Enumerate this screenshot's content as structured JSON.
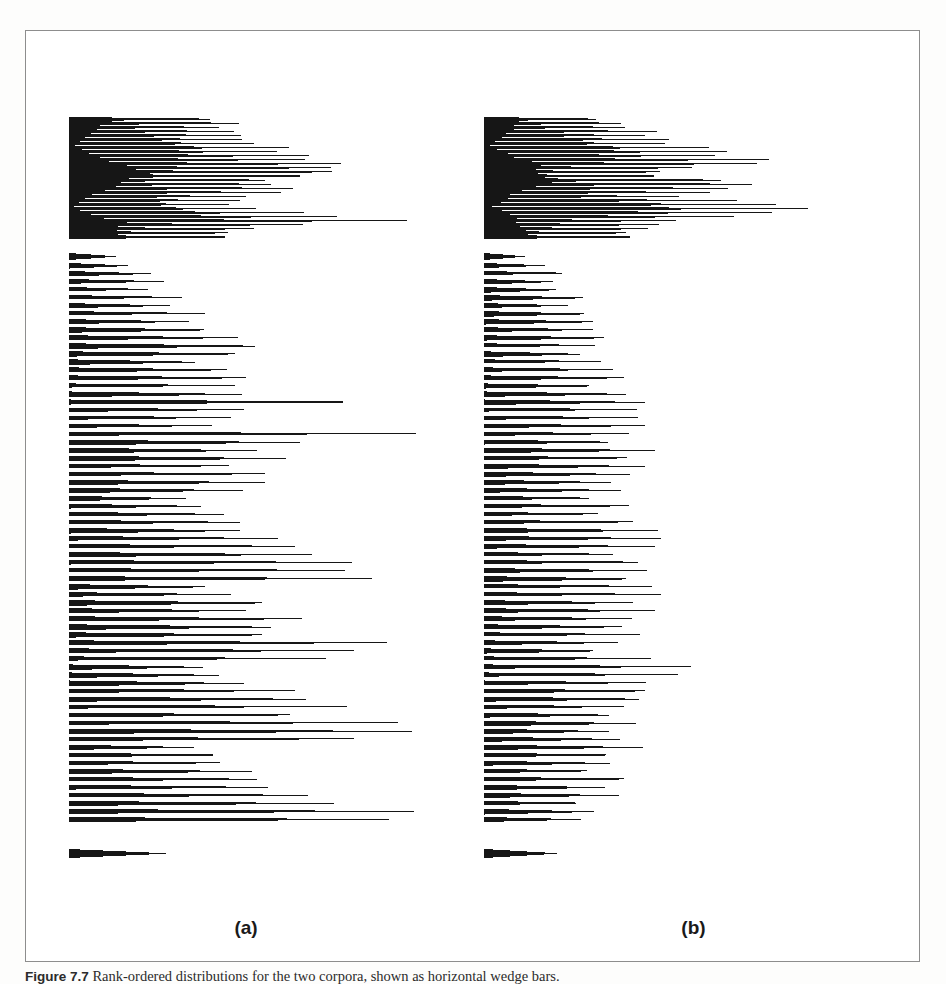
{
  "figure": {
    "panel_a_label": "(a)",
    "panel_b_label": "(b)",
    "caption_lead": "Figure 7.7",
    "caption_text": "Rank-ordered distributions for the two corpora, shown as horizontal wedge bars."
  },
  "colors": {
    "ink": "#161616",
    "frame": "#8d8d8d",
    "paper": "#ffffff"
  },
  "chart_data": [
    {
      "type": "bar",
      "orientation": "horizontal",
      "title": "(a)",
      "xlabel": "",
      "ylabel": "",
      "xlim": [
        0,
        400
      ],
      "grid": false,
      "legend": null,
      "note": "Rank-ordered horizontal wedge bars; bar n is drawn as a tapered wedge from the common left baseline to its value. Leading solid block is a dense cluster of very closely spaced long bars.",
      "baseline_x_px": 43,
      "row_pitch_px": 8.0,
      "first_row_y_px": 86,
      "categories": [
        "r1",
        "r2",
        "r3",
        "r4",
        "r5",
        "r6",
        "r7",
        "r8",
        "r9",
        "r10",
        "r11",
        "r12",
        "r13",
        "r14",
        "r15",
        "r16",
        "r17",
        "r18",
        "r19",
        "r20",
        "r21",
        "r22",
        "r23",
        "r24",
        "r25",
        "r26",
        "r27",
        "r28",
        "r29",
        "r30",
        "r31",
        "r32",
        "r33",
        "r34",
        "r35",
        "r36",
        "r37",
        "r38",
        "r39",
        "r40",
        "r41",
        "r42",
        "r43",
        "r44",
        "r45",
        "r46",
        "r47",
        "r48",
        "r49",
        "r50",
        "r51",
        "r52",
        "r53",
        "r54",
        "r55",
        "r56",
        "r57",
        "r58",
        "r59",
        "r60",
        "r61",
        "r62",
        "r63",
        "r64",
        "r65",
        "r66",
        "r67",
        "r68",
        "r69",
        "r70",
        "r71",
        "r72",
        "r73",
        "r74",
        "r75",
        "r76",
        "r77",
        "r78",
        "r79",
        "r80",
        "r81",
        "r82",
        "r83",
        "r84",
        "r85",
        "r86",
        "r87",
        "r88",
        "r89",
        "r90",
        "r91",
        "r92",
        "r93",
        "r94",
        "r95",
        "r96",
        "r97",
        "r98"
      ],
      "values": [
        150,
        158,
        162,
        168,
        172,
        176,
        181,
        186,
        192,
        198,
        207,
        218,
        232,
        248,
        262,
        300,
        286,
        246,
        207,
        190,
        230,
        226,
        196,
        172,
        162,
        158,
        182,
        214,
        258,
        330,
        260,
        206,
        178,
        165,
        160,
        0,
        62,
        0,
        74,
        0,
        80,
        0,
        86,
        0,
        0,
        96,
        0,
        104,
        0,
        118,
        0,
        130,
        0,
        152,
        0,
        165,
        0,
        178,
        0,
        150,
        0,
        142,
        0,
        168,
        0,
        208,
        0,
        190,
        0,
        176,
        0,
        248,
        0,
        200,
        0,
        190,
        0,
        166,
        0,
        300,
        0,
        212,
        0,
        186,
        0,
        176,
        0,
        196,
        0,
        170,
        0,
        160,
        0,
        148,
        0,
        108
      ],
      "lower_block_values": [
        62,
        74,
        80,
        86,
        96,
        104,
        118,
        130,
        152,
        165,
        178,
        150,
        142,
        168,
        208,
        190,
        176,
        248,
        200,
        190,
        166,
        300,
        212,
        186,
        176,
        196,
        170,
        160,
        148,
        108,
        122,
        140,
        156,
        172,
        188,
        205,
        218,
        236,
        250,
        268,
        142,
        160,
        180,
        198,
        214,
        232,
        248,
        260,
        272,
        286,
        160,
        176,
        192,
        208,
        226,
        240,
        258,
        276,
        292,
        258,
        148,
        164,
        182,
        200,
        218,
        236,
        252,
        268,
        284,
        265
      ],
      "tail_bar_value": 95
    },
    {
      "type": "bar",
      "orientation": "horizontal",
      "title": "(b)",
      "xlabel": "",
      "ylabel": "",
      "xlim": [
        0,
        400
      ],
      "grid": false,
      "legend": null,
      "note": "Same construction as panel (a) but the distribution decays faster; most bars are shorter and the solid leading block is proportionally wider.",
      "baseline_x_px": 18,
      "row_pitch_px": 8.0,
      "first_row_y_px": 86,
      "categories": [
        "r1",
        "r2",
        "r3",
        "r4",
        "r5",
        "r6",
        "r7",
        "r8",
        "r9",
        "r10",
        "r11",
        "r12",
        "r13",
        "r14",
        "r15",
        "r16",
        "r17",
        "r18",
        "r19",
        "r20",
        "r21",
        "r22",
        "r23",
        "r24",
        "r25",
        "r26",
        "r27",
        "r28",
        "r29",
        "r30",
        "r31",
        "r32",
        "r33",
        "r34",
        "r35",
        "r36",
        "r37",
        "r38",
        "r39",
        "r40",
        "r41",
        "r42",
        "r43",
        "r44",
        "r45",
        "r46",
        "r47",
        "r48",
        "r49",
        "r50",
        "r51",
        "r52",
        "r53",
        "r54",
        "r55",
        "r56",
        "r57",
        "r58",
        "r59",
        "r60",
        "r61",
        "r62",
        "r63",
        "r64",
        "r65",
        "r66",
        "r67",
        "r68",
        "r69",
        "r70",
        "r71",
        "r72",
        "r73",
        "r74",
        "r75",
        "r76",
        "r77",
        "r78",
        "r79",
        "r80",
        "r81",
        "r82",
        "r83",
        "r84",
        "r85",
        "r86",
        "r87",
        "r88",
        "r89",
        "r90",
        "r91",
        "r92",
        "r93",
        "r94",
        "r95",
        "r96",
        "r97",
        "r98"
      ],
      "values": [
        130,
        136,
        142,
        150,
        158,
        166,
        176,
        188,
        202,
        218,
        238,
        262,
        292,
        260,
        228,
        200,
        186,
        214,
        246,
        268,
        240,
        214,
        196,
        230,
        268,
        310,
        355,
        300,
        250,
        214,
        190,
        176,
        168,
        160,
        152,
        0,
        70,
        0,
        82,
        0,
        92,
        0,
        100,
        0,
        0,
        112,
        0,
        120,
        0,
        128,
        0,
        136,
        0,
        144,
        0,
        152,
        0,
        158,
        0,
        130,
        0,
        125,
        0,
        138,
        0,
        150,
        0,
        142,
        0,
        136,
        0,
        160,
        0,
        148,
        0,
        140,
        0,
        132,
        0,
        172,
        0,
        150,
        0,
        140,
        0,
        134,
        0,
        146,
        0,
        136,
        0,
        128,
        0,
        120,
        0,
        86
      ],
      "tail_bar_value": 72
    }
  ]
}
